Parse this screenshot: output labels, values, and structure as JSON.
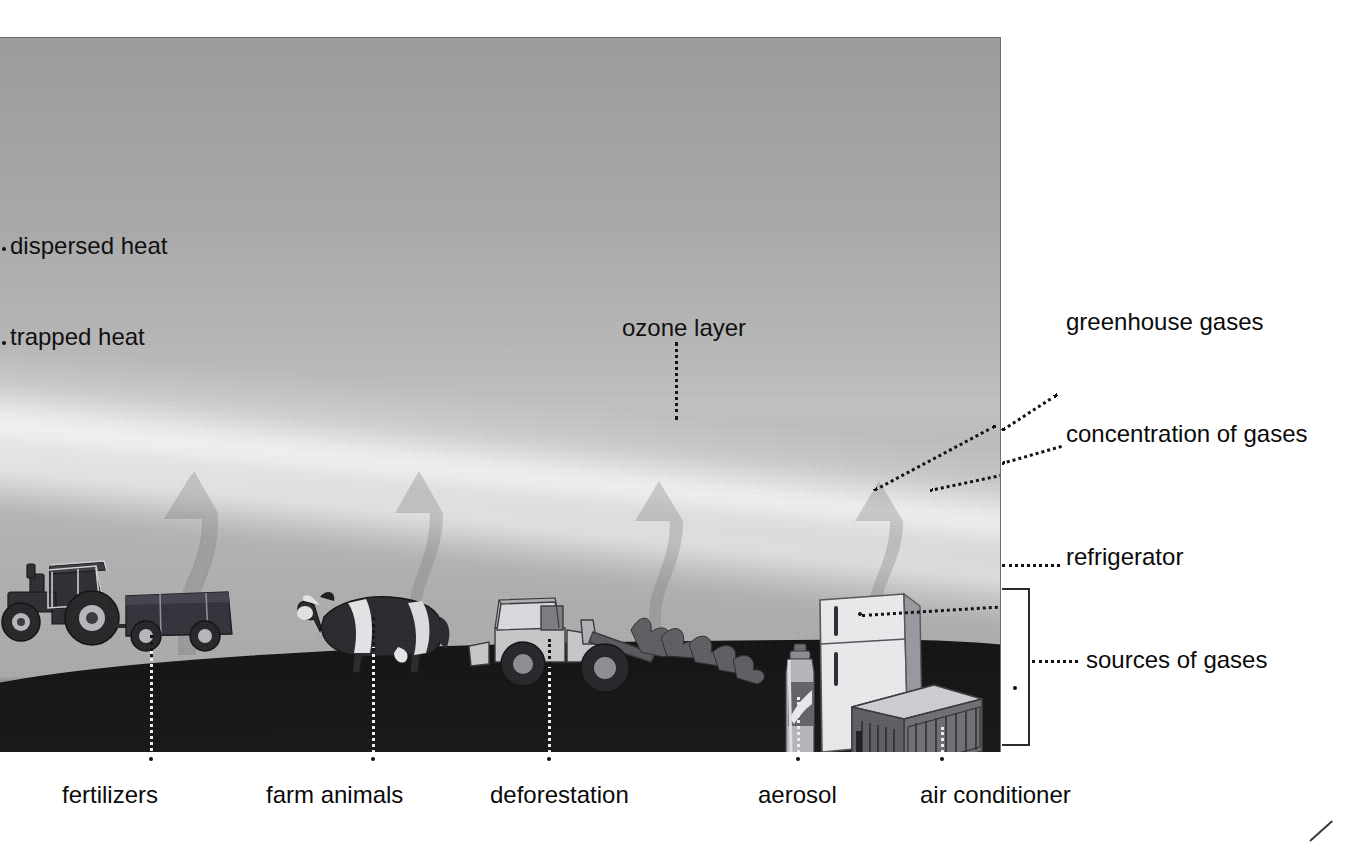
{
  "diagram": {
    "colors": {
      "sky_top": "#9d9d9d",
      "sky_mid": "#c2c2c2",
      "ozone_band": "#ffffff",
      "ground": "#141414",
      "label_text": "#0b0b0b",
      "leader_dark": "#111111",
      "leader_light": "#f2f2f2"
    }
  },
  "labels": {
    "dispersed_heat": "dispersed heat",
    "trapped_heat": "trapped heat",
    "ozone_layer": "ozone layer",
    "greenhouse_gases": "greenhouse gases",
    "concentration_of_gases": "concentration of gases",
    "refrigerator": "refrigerator",
    "sources_of_gases": "sources of gases",
    "fertilizers": "fertilizers",
    "farm_animals": "farm animals",
    "deforestation": "deforestation",
    "aerosol": "aerosol",
    "air_conditioner": "air conditioner"
  },
  "scene_objects": [
    {
      "name": "tractor-with-trailer",
      "label_key": "fertilizers"
    },
    {
      "name": "cow",
      "label_key": "farm_animals"
    },
    {
      "name": "logging-skidder-with-felled-trees",
      "label_key": "deforestation"
    },
    {
      "name": "aerosol-can",
      "label_key": "aerosol"
    },
    {
      "name": "refrigerator",
      "label_key": "refrigerator"
    },
    {
      "name": "air-conditioner-unit",
      "label_key": "air_conditioner"
    }
  ],
  "arrows": {
    "count": 4,
    "meaning": "rising greenhouse gas emissions"
  }
}
